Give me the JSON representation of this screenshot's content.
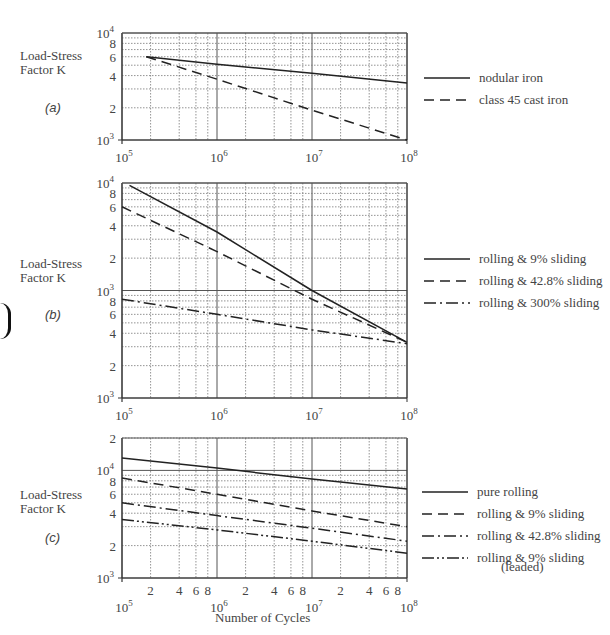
{
  "chart_data": [
    {
      "type": "line",
      "panel": "(a)",
      "ylabel": "Load-Stress Factor K",
      "xlabel": "Number of Cycles",
      "xscale": "log",
      "yscale": "log",
      "xlim": [
        100000,
        100000000
      ],
      "ylim": [
        1000,
        10000
      ],
      "x_tick_labels": [
        "10^5",
        "10^6",
        "10^7",
        "10^8"
      ],
      "y_tick_labels": [
        "10^3",
        "2",
        "4",
        "6",
        "8",
        "10^4"
      ],
      "grid": true,
      "legend_position": "right",
      "series": [
        {
          "name": "nodular iron",
          "style": "solid",
          "x": [
            180000,
            1000000,
            10000000,
            100000000
          ],
          "y": [
            6000,
            5100,
            4200,
            3400
          ]
        },
        {
          "name": "class 45 cast iron",
          "style": "dashed",
          "x": [
            180000,
            1000000,
            10000000,
            100000000
          ],
          "y": [
            6000,
            3700,
            1900,
            1000
          ]
        }
      ]
    },
    {
      "type": "line",
      "panel": "(b)",
      "ylabel": "Load-Stress Factor K",
      "xlabel": "Number of Cycles",
      "xscale": "log",
      "yscale": "log",
      "xlim": [
        100000,
        100000000
      ],
      "ylim": [
        100,
        10000
      ],
      "x_tick_labels": [
        "10^5",
        "10^6",
        "10^7",
        "10^8"
      ],
      "y_tick_labels": [
        "10^3",
        "2",
        "4",
        "6",
        "8",
        "10^3",
        "2",
        "4",
        "6",
        "8",
        "10^4"
      ],
      "grid": true,
      "legend_position": "right",
      "series": [
        {
          "name": "rolling & 9% sliding",
          "style": "solid",
          "x": [
            120000,
            1000000,
            10000000,
            100000000
          ],
          "y": [
            9500,
            3500,
            1000,
            330
          ]
        },
        {
          "name": "rolling & 42.8% sliding",
          "style": "dashed",
          "x": [
            100000,
            1000000,
            10000000,
            100000000
          ],
          "y": [
            6000,
            2300,
            830,
            330
          ]
        },
        {
          "name": "rolling & 300% sliding",
          "style": "dash-dot",
          "x": [
            100000,
            1000000,
            10000000,
            100000000
          ],
          "y": [
            830,
            600,
            430,
            320
          ]
        }
      ]
    },
    {
      "type": "line",
      "panel": "(c)",
      "ylabel": "Load-Stress Factor K",
      "xlabel": "Number of Cycles",
      "xscale": "log",
      "yscale": "log",
      "xlim": [
        100000,
        100000000
      ],
      "ylim": [
        1000,
        20000
      ],
      "x_tick_labels": [
        "10^5",
        "2",
        "4",
        "6",
        "8",
        "10^6",
        "2",
        "4",
        "6",
        "8",
        "10^7",
        "2",
        "4",
        "6",
        "8",
        "10^8"
      ],
      "y_tick_labels": [
        "10^3",
        "2",
        "4",
        "6",
        "8",
        "10^4",
        "2"
      ],
      "grid": true,
      "legend_position": "right",
      "series": [
        {
          "name": "pure rolling",
          "style": "solid",
          "x": [
            100000,
            1000000,
            10000000,
            100000000
          ],
          "y": [
            13000,
            10500,
            8300,
            6700
          ]
        },
        {
          "name": "rolling & 9% sliding",
          "style": "dashed",
          "x": [
            100000,
            1000000,
            10000000,
            100000000
          ],
          "y": [
            8500,
            6000,
            4200,
            3000
          ]
        },
        {
          "name": "rolling & 42.8% sliding",
          "style": "dash-dot",
          "x": [
            100000,
            1000000,
            10000000,
            100000000
          ],
          "y": [
            5000,
            3800,
            2900,
            2200
          ]
        },
        {
          "name": "rolling & 9% sliding (leaded)",
          "style": "dash-dot-dot",
          "x": [
            100000,
            1000000,
            10000000,
            100000000
          ],
          "y": [
            3500,
            2800,
            2200,
            1700
          ]
        }
      ]
    }
  ],
  "labels": {
    "ylabel_line1": "Load-Stress",
    "ylabel_line2": "Factor  K",
    "panel_a": "(a)",
    "panel_b": "(b)",
    "panel_c": "(c)",
    "xtitle": "Number of Cycles"
  },
  "legends": {
    "a": [
      "nodular iron",
      "class 45 cast iron"
    ],
    "b": [
      "rolling & 9% sliding",
      "rolling & 42.8% sliding",
      "rolling & 300% sliding"
    ],
    "c": [
      "pure rolling",
      "rolling & 9% sliding",
      "rolling & 42.8% sliding",
      "rolling & 9% sliding"
    ],
    "c_sub": "(leaded)"
  }
}
